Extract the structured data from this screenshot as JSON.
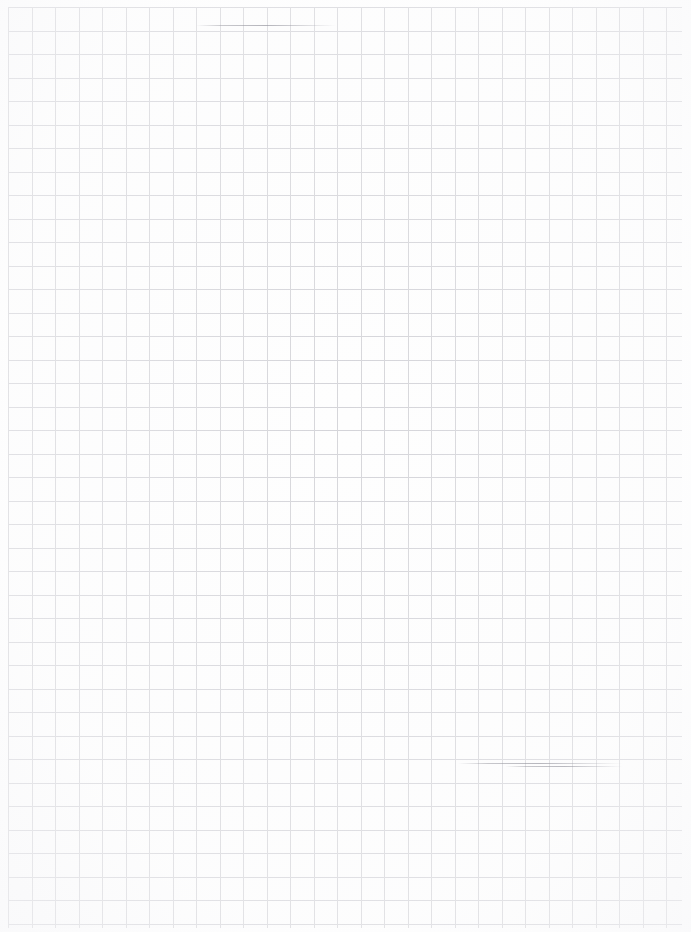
{
  "document": {
    "kind": "blank-grid-paper-scan",
    "title": "Blank graph paper sheet",
    "visible_text": "",
    "page_width_px": 691,
    "page_height_px": 932
  },
  "paper": {
    "background_color": "#ffffff",
    "surface_color": "#fefefe"
  },
  "grid": {
    "cell_size_px": 23.5,
    "line_width_px": 1,
    "vertical_line_color": "#d6d6da",
    "horizontal_line_color": "#d4d4d9",
    "origin_x_px": 8,
    "origin_y_px": 7,
    "column_count": 29,
    "row_count": 39,
    "style": "square-grid"
  },
  "margins": {
    "left_px": 8,
    "top_px": 7,
    "right_px": 9,
    "bottom_px": 4,
    "color": "#ffffff"
  },
  "artifacts": [
    {
      "name": "upper-rule-darkening",
      "x": 196,
      "y": 25,
      "width": 140,
      "height": 1
    },
    {
      "name": "lower-rule-darkening",
      "x": 458,
      "y": 763,
      "width": 165,
      "height": 1
    },
    {
      "name": "lower-rule-darkening-secondary",
      "x": 505,
      "y": 766,
      "width": 118,
      "height": 1
    }
  ],
  "content": {
    "has_writing": false,
    "has_images": false,
    "has_annotations": false,
    "note": ""
  }
}
